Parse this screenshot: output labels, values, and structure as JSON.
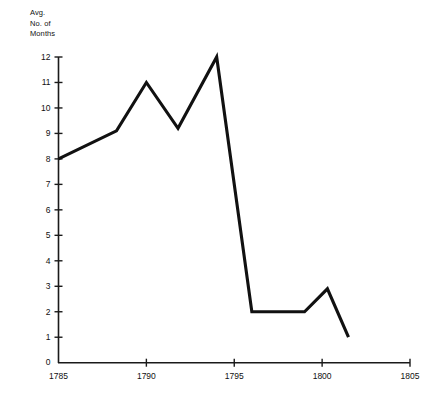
{
  "chart_data": {
    "type": "line",
    "title": "",
    "subtitle": "",
    "xlabel": "",
    "ylabel": "Avg.\nNo. of\nMonths",
    "ylabel_lines": [
      "Avg.",
      "No. of",
      "Months"
    ],
    "xlim": [
      1785,
      1805
    ],
    "ylim": [
      0,
      12
    ],
    "xticks": [
      1785,
      1790,
      1795,
      1800,
      1805
    ],
    "xtick_labels": [
      "1785",
      "1790",
      "1795",
      "1800",
      "1805"
    ],
    "yticks": [
      0,
      1,
      2,
      3,
      4,
      5,
      6,
      7,
      8,
      9,
      10,
      11,
      12
    ],
    "ytick_labels": [
      "0",
      "1",
      "2",
      "3",
      "4",
      "5",
      "6",
      "7",
      "8",
      "9",
      "10",
      "11",
      "12"
    ],
    "grid": false,
    "legend": null,
    "series": [
      {
        "name": "Avg. No. of Months",
        "color": "#111111",
        "x": [
          1785.0,
          1788.3,
          1790.0,
          1791.8,
          1794.0,
          1796.0,
          1799.0,
          1800.3,
          1801.5
        ],
        "values": [
          8.0,
          9.1,
          11.0,
          9.2,
          12.0,
          2.0,
          2.0,
          2.9,
          1.0
        ]
      }
    ],
    "annotations": []
  }
}
